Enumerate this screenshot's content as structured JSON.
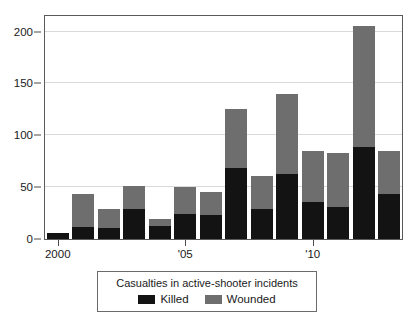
{
  "figure": {
    "title_sliver": "",
    "background": "#ffffff"
  },
  "colors": {
    "killed": "#131313",
    "wounded": "#6e6e6e",
    "gridline": "#d9d9d9",
    "frame": "#5a5a5a",
    "text": "#1a1a1a"
  },
  "legend": {
    "title": "Casualties in active-shooter incidents",
    "entries": [
      {
        "label": "Killed",
        "color": "#131313"
      },
      {
        "label": "Wounded",
        "color": "#6e6e6e"
      }
    ]
  },
  "axes": {
    "y_ticks": [
      "0",
      "50",
      "100",
      "150",
      "200"
    ],
    "x_ticks": [
      "2000",
      "'05",
      "'10"
    ]
  },
  "chart_data": {
    "type": "bar",
    "subtype": "stacked",
    "title": "Casualties in active-shooter incidents",
    "xlabel": "",
    "ylabel": "",
    "ylim": [
      0,
      215
    ],
    "ytick_values": [
      0,
      50,
      100,
      150,
      200
    ],
    "grid": true,
    "legend_position": "below-plot",
    "categories": [
      "2000",
      "2001",
      "2002",
      "2003",
      "2004",
      "2005",
      "2006",
      "2007",
      "2008",
      "2009",
      "2010",
      "2011",
      "2012",
      "2013"
    ],
    "xtick_labels": {
      "2000": "2000",
      "2005": "'05",
      "2010": "'10"
    },
    "series": [
      {
        "name": "Killed",
        "color": "#131313",
        "values": [
          6,
          12,
          11,
          29,
          13,
          24,
          23,
          68,
          29,
          63,
          36,
          31,
          89,
          43
        ]
      },
      {
        "name": "Wounded",
        "color": "#6e6e6e",
        "values": [
          0,
          31,
          18,
          22,
          6,
          26,
          22,
          57,
          32,
          77,
          49,
          52,
          116,
          42
        ]
      }
    ],
    "totals": [
      6,
      43,
      29,
      51,
      19,
      50,
      45,
      125,
      61,
      140,
      85,
      83,
      205,
      85
    ]
  }
}
